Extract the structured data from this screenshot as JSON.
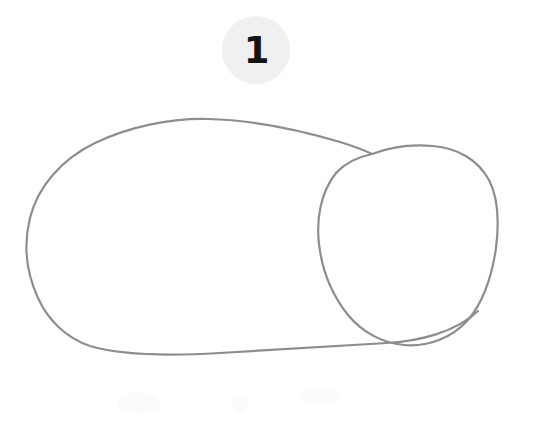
{
  "page": {
    "background_color": "#ffffff",
    "width": 534,
    "height": 424
  },
  "step_badge": {
    "number": "1",
    "fill_color": "#f0f0f0",
    "text_color": "#151515",
    "center_x": 256,
    "center_y": 50,
    "radius": 34
  },
  "drawing": {
    "medium": "pencil-sketch",
    "stroke_color": "#8d8d8d",
    "stroke_width": 2.2,
    "subject": "two-overlapping-shapes",
    "shapes": [
      {
        "name": "body-outline",
        "type": "hand-drawn-oval",
        "bounds": {
          "x": 28,
          "y": 118,
          "width": 362,
          "height": 236
        },
        "description": "large irregular oval forming the body"
      },
      {
        "name": "head-outline",
        "type": "hand-drawn-circle",
        "bounds": {
          "x": 318,
          "y": 145,
          "width": 180,
          "height": 201
        },
        "description": "rounded circle forming the head, overlapping the body on the right"
      }
    ],
    "intersections": [
      {
        "name": "top-junction",
        "x": 368,
        "y": 152
      },
      {
        "name": "bottom-junction",
        "x": 387,
        "y": 343
      }
    ]
  },
  "paper_marks": [
    {
      "name": "smudge-left",
      "x": 118,
      "y": 392,
      "width": 42,
      "height": 22
    },
    {
      "name": "smudge-center",
      "x": 232,
      "y": 396,
      "width": 16,
      "height": 18
    },
    {
      "name": "smudge-right",
      "x": 300,
      "y": 388,
      "width": 38,
      "height": 16
    }
  ]
}
